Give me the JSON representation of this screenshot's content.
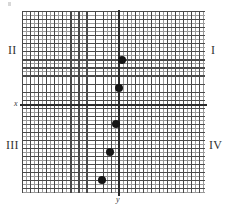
{
  "figure": {
    "title": "",
    "width": 229,
    "height": 210
  },
  "axes": {
    "x_label": "x",
    "y_label": "y",
    "x_axis_name": "x-axis",
    "y_axis_name": "y-axis"
  },
  "quadrants": [
    {
      "id": "I",
      "label": "I"
    },
    {
      "id": "II",
      "label": "II"
    },
    {
      "id": "III",
      "label": "III"
    },
    {
      "id": "IV",
      "label": "IV"
    }
  ],
  "chart_data": {
    "type": "scatter",
    "title": "",
    "xlabel": "x",
    "ylabel": "y",
    "grid": true,
    "legend": null,
    "grid_minor_step": 1,
    "grid_major_step": 2,
    "xlim": [
      -24,
      21
    ],
    "ylim": [
      -22,
      23
    ],
    "point_color": "#151515",
    "axis_color": "#2b2b2b",
    "grid_major_color": "#4a4a4a",
    "grid_minor_color": "#9a9a9a",
    "points": [
      {
        "x": 1,
        "y": 11,
        "px": 122,
        "py": 60
      },
      {
        "x": 0,
        "y": 4,
        "px": 119,
        "py": 88
      },
      {
        "x": -1,
        "y": -5,
        "px": 116,
        "py": 124
      },
      {
        "x": -2,
        "y": -12,
        "px": 110,
        "py": 152
      },
      {
        "x": -4,
        "y": -19,
        "px": 102,
        "py": 180
      }
    ]
  }
}
